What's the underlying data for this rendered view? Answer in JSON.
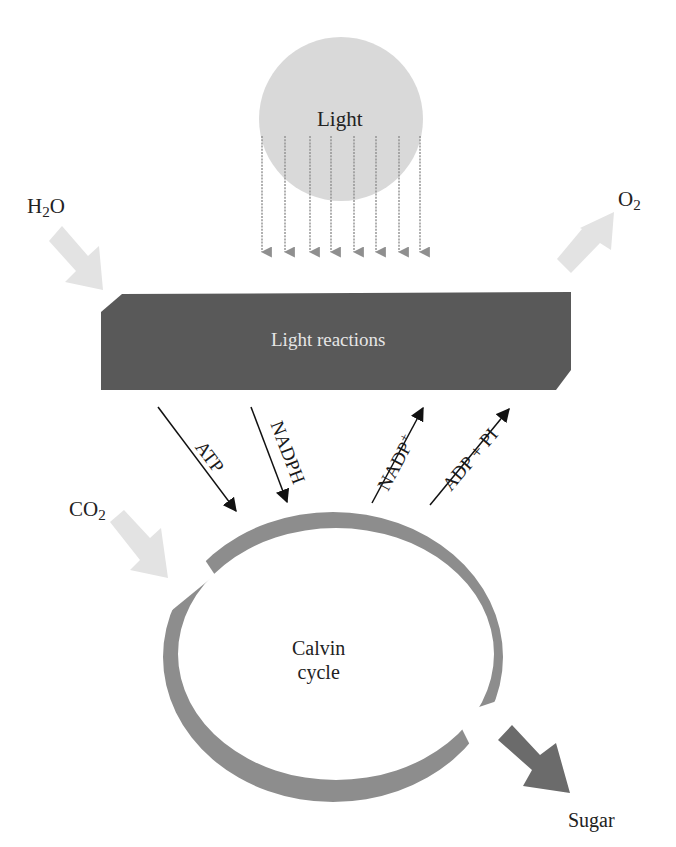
{
  "diagram": {
    "colors": {
      "light_circle": "#d9d9d9",
      "light_rays": "#8f8f8f",
      "input_arrows": "#e3e3e3",
      "light_reactions_bar": "#595959",
      "light_reactions_text": "#e6e6e6",
      "calvin_ring": "#8d8d8d",
      "sugar_arrow": "#6b6b6b",
      "text": "#222222",
      "black_arrows": "#111111"
    },
    "nodes": {
      "light": {
        "label": "Light"
      },
      "light_reactions": {
        "label": "Light reactions"
      },
      "calvin_cycle": {
        "label_line1": "Calvin",
        "label_line2": "cycle"
      }
    },
    "inputs_outputs": {
      "water": {
        "main": "H",
        "sub": "2",
        "tail": "O"
      },
      "oxygen": {
        "main": "O",
        "sub": "2"
      },
      "carbon_dioxide": {
        "main": "CO",
        "sub": "2"
      },
      "sugar": {
        "label": "Sugar"
      }
    },
    "transfers": {
      "atp": {
        "label": "ATP",
        "direction": "light reactions → Calvin cycle"
      },
      "nadph": {
        "label": "NADPH",
        "direction": "light reactions → Calvin cycle"
      },
      "nadp_plus": {
        "main": "NADP",
        "sup": "+",
        "direction": "Calvin cycle → light reactions"
      },
      "adp_pi": {
        "label": "ADP + PI",
        "direction": "Calvin cycle → light reactions"
      }
    },
    "light_rays_count": 8
  }
}
